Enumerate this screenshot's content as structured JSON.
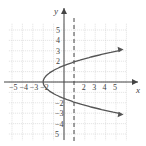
{
  "chart_data": {
    "type": "line",
    "title": "",
    "xlabel": "x",
    "ylabel": "y",
    "xlim": [
      -5.5,
      6
    ],
    "ylim": [
      -6,
      6
    ],
    "grid": true,
    "x_tick_labels": [
      "-5",
      "-4",
      "-3",
      "-2",
      "2",
      "3",
      "4",
      "5"
    ],
    "y_tick_labels_positive": [
      "5",
      "4",
      "3",
      "2"
    ],
    "y_tick_labels_negative": [
      "-2",
      "-3",
      "-4",
      "5"
    ],
    "series": [
      {
        "name": "sideways parabola",
        "equation_estimate": "x = 0.8y^2 - 2",
        "vertex": [
          -2,
          0
        ],
        "points": [
          [
            5.2,
            3
          ],
          [
            3,
            2.5
          ],
          [
            1.2,
            2
          ],
          [
            0,
            1.58
          ],
          [
            -1.2,
            1
          ],
          [
            -2,
            0
          ],
          [
            -1.2,
            -1
          ],
          [
            0,
            -1.58
          ],
          [
            1.2,
            -2
          ],
          [
            3,
            -2.5
          ],
          [
            5.2,
            -3
          ]
        ],
        "arrows": "both ends"
      }
    ],
    "annotations": [
      {
        "type": "dashed_vertical_line",
        "x": 1
      }
    ],
    "colors": {
      "curve": "#555555",
      "grid": "#cccccc",
      "axis": "#444444"
    }
  }
}
